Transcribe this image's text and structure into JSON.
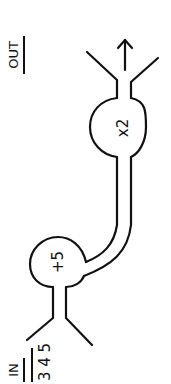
{
  "diagram": {
    "orientation": "rotated-90-ccw",
    "input": {
      "label": "IN",
      "values": "3 4 5"
    },
    "output": {
      "label": "OUT"
    },
    "nodes": [
      {
        "id": "add",
        "label": "+5"
      },
      {
        "id": "mul",
        "label": "x2"
      }
    ],
    "flow": [
      "IN",
      "+5",
      "x2",
      "OUT"
    ],
    "colors": {
      "ink": "#111111",
      "background": "#ffffff"
    }
  }
}
